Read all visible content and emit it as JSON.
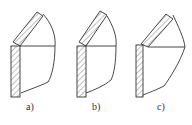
{
  "figures": [
    {
      "label": "a)",
      "description": "fillet-welded corner joint, slanted plate meeting vertical plate edge"
    },
    {
      "label": "b)",
      "description": "corner joint variant with slanted plate offset"
    },
    {
      "label": "c)",
      "description": "corner joint variant with slanted plate beveled against vertical plate"
    }
  ],
  "colors": {
    "line": "#333333",
    "background": "#ffffff"
  }
}
